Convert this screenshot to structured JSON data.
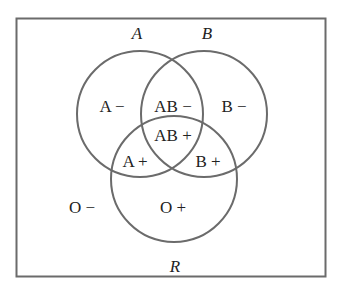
{
  "diagram": {
    "type": "venn",
    "universe_label": "R",
    "sets": [
      {
        "name": "A",
        "label": "A"
      },
      {
        "name": "B",
        "label": "B"
      },
      {
        "name": "R",
        "label": "R"
      }
    ],
    "regions": {
      "a_only": "A −",
      "ab_only": "AB −",
      "b_only": "B −",
      "abr": "AB +",
      "ar": "A +",
      "br": "B +",
      "r_only": "O +",
      "outside": "O −"
    },
    "colors": {
      "stroke": "#6b6b6b",
      "text": "#222222",
      "background": "#ffffff"
    }
  }
}
